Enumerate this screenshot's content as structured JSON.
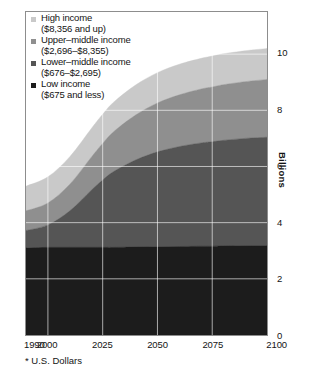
{
  "figure": {
    "footnote": "* U.S. Dollars",
    "y_axis_title": "Billions"
  },
  "legend": {
    "items": [
      {
        "label": "High income",
        "range": "($8,356 and up)",
        "color": "#c9c9c9",
        "swatch_name": "legend-swatch-high-income"
      },
      {
        "label": "Upper–middle income",
        "range": "($2,696–$8,355)",
        "color": "#8f8f8f",
        "swatch_name": "legend-swatch-upper-middle-income"
      },
      {
        "label": "Lower–middle income",
        "range": "($676–$2,695)",
        "color": "#555555",
        "swatch_name": "legend-swatch-lower-middle-income"
      },
      {
        "label": "Low income",
        "range": "($675 and less)",
        "color": "#1c1c1c",
        "swatch_name": "legend-swatch-low-income"
      }
    ]
  },
  "chart_data": {
    "type": "area",
    "title": "",
    "subtitle": "",
    "xlabel": "",
    "ylabel": "Billions",
    "stacked": true,
    "grid": true,
    "legend_position": "top-left-inside",
    "xlim": [
      1990,
      2100
    ],
    "ylim": [
      0,
      11.5
    ],
    "xticks": [
      1990,
      2000,
      2025,
      2050,
      2075,
      2100
    ],
    "xtick_labels": [
      "1990",
      "2000",
      "2025",
      "2050",
      "2075",
      "2100"
    ],
    "yticks": [
      0,
      2,
      4,
      6,
      8,
      10
    ],
    "ytick_labels": [
      "0",
      "2",
      "4",
      "6",
      "8",
      "10"
    ],
    "x": [
      1990,
      2000,
      2010,
      2020,
      2025,
      2030,
      2040,
      2050,
      2060,
      2070,
      2075,
      2080,
      2090,
      2100
    ],
    "series": [
      {
        "name": "Low income",
        "color": "#1c1c1c",
        "values": [
          3.1,
          3.12,
          3.12,
          3.12,
          3.12,
          3.12,
          3.13,
          3.14,
          3.15,
          3.16,
          3.16,
          3.17,
          3.18,
          3.18
        ]
      },
      {
        "name": "Lower-middle income",
        "color": "#555555",
        "values": [
          0.62,
          0.8,
          1.3,
          2.05,
          2.4,
          2.7,
          3.1,
          3.38,
          3.56,
          3.68,
          3.72,
          3.76,
          3.82,
          3.86
        ]
      },
      {
        "name": "Upper-middle income",
        "color": "#8f8f8f",
        "values": [
          0.7,
          0.78,
          0.95,
          1.18,
          1.3,
          1.42,
          1.6,
          1.74,
          1.84,
          1.92,
          1.95,
          1.98,
          2.02,
          2.06
        ]
      },
      {
        "name": "High income",
        "color": "#c9c9c9",
        "values": [
          0.88,
          0.93,
          0.98,
          1.02,
          1.04,
          1.05,
          1.07,
          1.08,
          1.09,
          1.09,
          1.1,
          1.1,
          1.1,
          1.1
        ]
      }
    ]
  }
}
